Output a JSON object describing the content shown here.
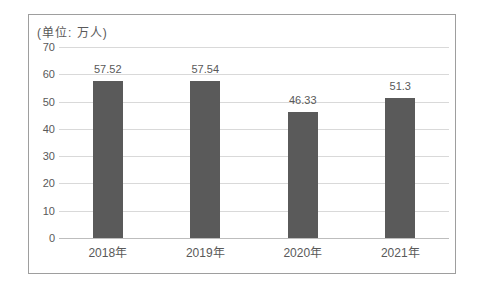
{
  "chart_data": {
    "type": "bar",
    "title": "",
    "unit_label": "(单位: 万人)",
    "categories": [
      "2018年",
      "2019年",
      "2020年",
      "2021年"
    ],
    "values": [
      57.52,
      57.54,
      46.33,
      51.3
    ],
    "value_labels": [
      "57.52",
      "57.54",
      "46.33",
      "51.3"
    ],
    "xlabel": "",
    "ylabel": "",
    "ylim": [
      0,
      70
    ],
    "yticks": [
      0,
      10,
      20,
      30,
      40,
      50,
      60,
      70
    ],
    "grid": true,
    "legend_position": "none",
    "colors": {
      "bar": "#5a5a5a",
      "gridline": "#d9d9d9",
      "axis_line": "#bdbdbd",
      "text": "#595959",
      "frame_border": "#9e9e9e",
      "background": "#ffffff"
    }
  }
}
